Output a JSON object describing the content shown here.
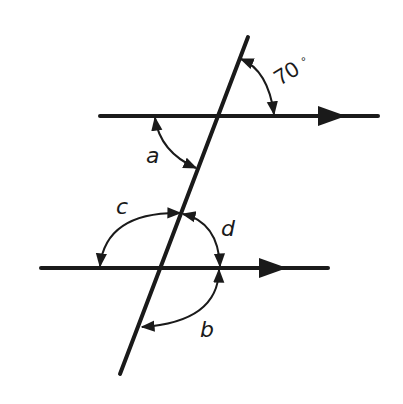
{
  "diagram": {
    "type": "parallel lines cut by a transversal",
    "colors": {
      "ink": "#1a1a1a",
      "background": "#ffffff"
    },
    "lines": {
      "top_parallel": {
        "from": [
          100,
          116
        ],
        "to": [
          378,
          116
        ],
        "arrow": "right"
      },
      "bottom_parallel": {
        "from": [
          41,
          268
        ],
        "to": [
          328,
          268
        ],
        "arrow": "right"
      },
      "transversal": {
        "from": [
          248,
          37
        ],
        "to": [
          120,
          374
        ]
      }
    },
    "angles": [
      {
        "id": "given",
        "label": "70",
        "unit": "°",
        "note": "between transversal and top line, upper right"
      },
      {
        "id": "a",
        "label": "a",
        "note": "between top line and transversal, lower left"
      },
      {
        "id": "c",
        "label": "c",
        "note": "between bottom line left and transversal, upper"
      },
      {
        "id": "d",
        "label": "d",
        "note": "between transversal and bottom line right, upper"
      },
      {
        "id": "b",
        "label": "b",
        "note": "between bottom line right and transversal, lower"
      }
    ]
  }
}
